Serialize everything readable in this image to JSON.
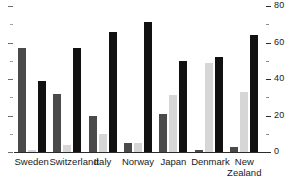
{
  "chart_data": {
    "type": "bar",
    "title": "",
    "subtitle": "",
    "xlabel": "",
    "ylabel": "",
    "ylim": [
      0,
      80
    ],
    "y_axis_position": "right",
    "grid": false,
    "legend": "none",
    "categories": [
      "Sweden",
      "Switzerland",
      "Italy",
      "Norway",
      "Japan",
      "Denmark",
      "New Zealand"
    ],
    "category_lines": [
      [
        "Sweden"
      ],
      [
        "Switzerland"
      ],
      [
        "Italy"
      ],
      [
        "Norway"
      ],
      [
        "Japan"
      ],
      [
        "Denmark"
      ],
      [
        "New",
        "Zealand"
      ]
    ],
    "y_ticks_major": [
      0,
      20,
      40,
      60,
      80
    ],
    "y_tick_labels": [
      "0",
      "20",
      "40",
      "60",
      "80"
    ],
    "y_ticks_minor": [
      10,
      30,
      50,
      70
    ],
    "series": [
      {
        "name": "series-1",
        "color": "#4a4a4a",
        "values": [
          57,
          32,
          20,
          5,
          21,
          1,
          3
        ]
      },
      {
        "name": "series-2",
        "color": "#d6d6d6",
        "values": [
          1,
          4,
          10,
          5,
          31,
          49,
          33
        ]
      },
      {
        "name": "series-3",
        "color": "#111111",
        "values": [
          39,
          57,
          66,
          71,
          50,
          52,
          64
        ]
      }
    ]
  },
  "colors": {
    "axis": "#2b2b2b",
    "background": "#ffffff",
    "series_1": "#4a4a4a",
    "series_2": "#d6d6d6",
    "series_3": "#111111"
  }
}
